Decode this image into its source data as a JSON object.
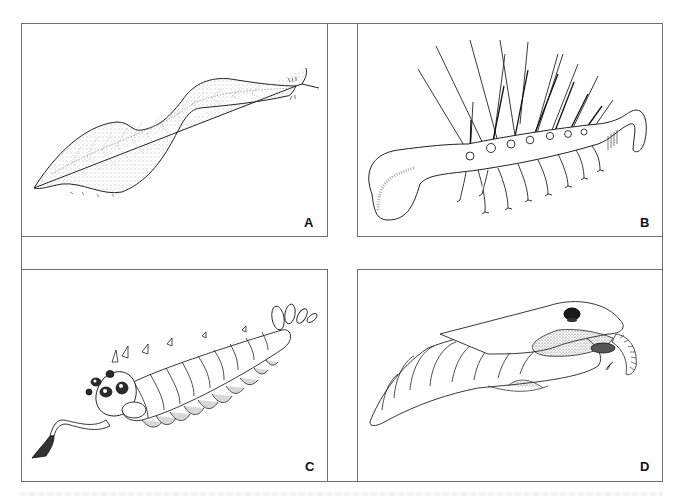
{
  "figure": {
    "layout": "2x2 grid of line-drawing panels",
    "frame_color": "#6e6e6e",
    "panels": [
      {
        "id": "A",
        "label": "A",
        "subject": "leaf-shaped stippled worm-like animal with forked head appendage"
      },
      {
        "id": "B",
        "label": "B",
        "subject": "worm-like animal with long dorsal spines and paired tentacle-like legs"
      },
      {
        "id": "C",
        "label": "C",
        "subject": "segmented animal with five stalked eyes, flexible frontal proboscis with claw, and fan tail"
      },
      {
        "id": "D",
        "label": "D",
        "subject": "segmented arthropod-like animal with lateral flaps, dorsal eye and curled frontal appendage"
      }
    ]
  }
}
